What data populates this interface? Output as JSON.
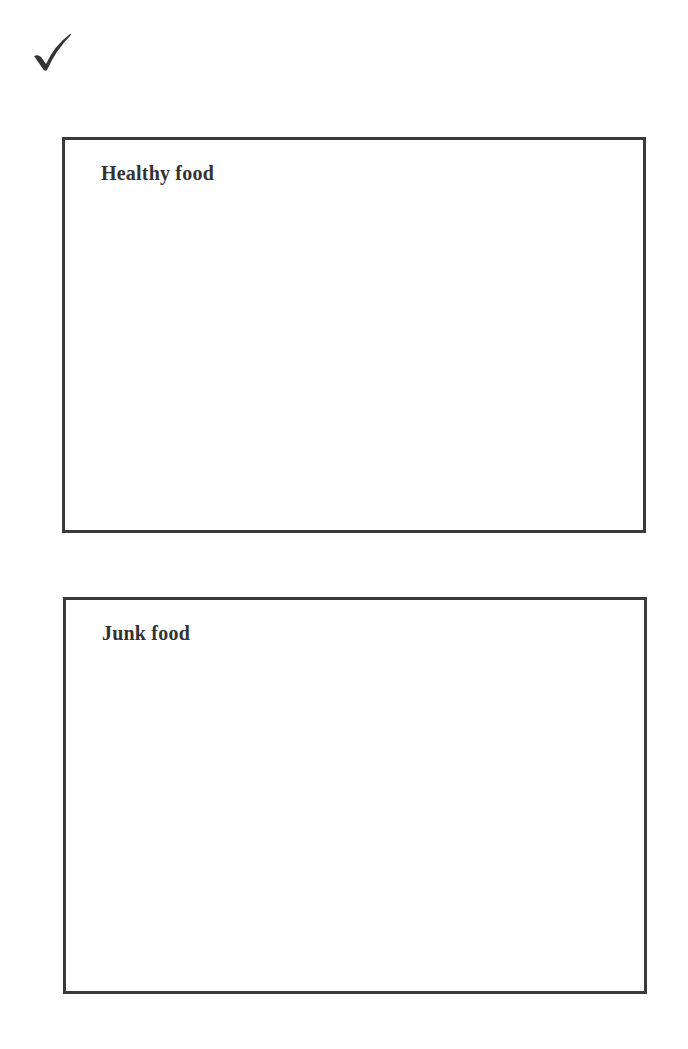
{
  "worksheet": {
    "check_icon": "checkmark-icon",
    "colors": {
      "border": "#3a3a3a",
      "text": "#333333",
      "background": "#ffffff"
    },
    "boxes": [
      {
        "label": "Healthy food"
      },
      {
        "label": "Junk food"
      }
    ]
  }
}
